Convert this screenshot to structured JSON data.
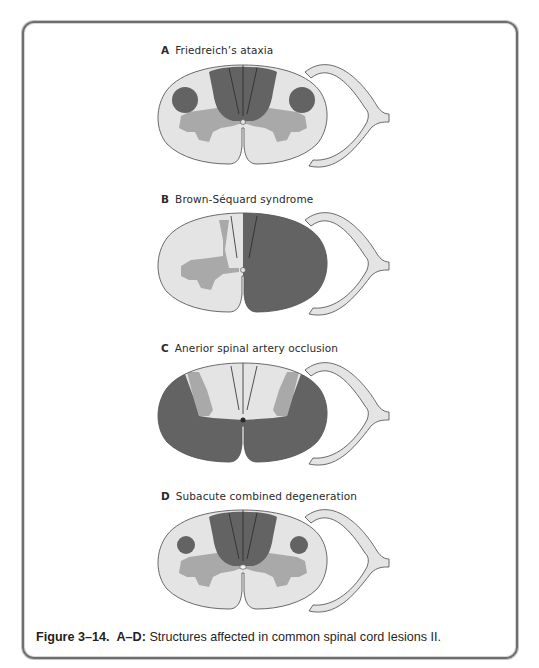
{
  "figure": {
    "number_label": "Figure 3–14.",
    "range_label": "A–D:",
    "caption_text": "Structures affected in common spinal cord lesions II."
  },
  "colors": {
    "lesion_dark": "#636363",
    "gray_matter": "#a9a9a9",
    "white_matter": "#e4e4e4",
    "outline": "#5a5a5a",
    "frame": "#6e6e6e"
  },
  "panels": [
    {
      "letter": "A",
      "title": "Friedreich’s ataxia",
      "affected": [
        "dorsal columns",
        "lateral corticospinal tracts (bilateral)"
      ]
    },
    {
      "letter": "B",
      "title": "Brown-Séquard syndrome",
      "affected": [
        "hemisection of one half of cord"
      ]
    },
    {
      "letter": "C",
      "title": "Anerior spinal artery occlusion",
      "affected": [
        "anterior two-thirds of cord"
      ]
    },
    {
      "letter": "D",
      "title": "Subacute combined degeneration",
      "affected": [
        "dorsal columns",
        "lateral corticospinal tracts (bilateral)"
      ]
    }
  ]
}
